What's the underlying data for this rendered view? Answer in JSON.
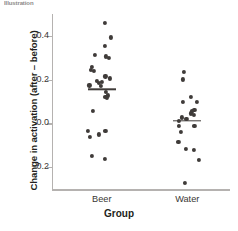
{
  "figure": {
    "top_sliver_text": "Illustration",
    "background": "#ffffff",
    "dot_color": "#3f3b39",
    "axis_color": "#b5b2b0"
  },
  "chart_data": {
    "type": "scatter",
    "title": "",
    "xlabel": "Group",
    "ylabel": "Change in activation (after – before)",
    "categories": [
      "Beer",
      "Water"
    ],
    "ytick_labels": [
      "0.4",
      "0.2",
      "0.0",
      "−0.2"
    ],
    "ytick_values": [
      0.4,
      0.2,
      0.0,
      -0.2
    ],
    "ylim": [
      -0.3,
      0.5
    ],
    "grid": false,
    "legend": "none",
    "annotations": [
      "horizontal bar marks the group mean"
    ],
    "series": [
      {
        "name": "Beer",
        "mean": 0.155,
        "jitter_center_pct": 28,
        "points": [
          {
            "x_pct": 29.5,
            "y": 0.459
          },
          {
            "x_pct": 33.0,
            "y": 0.393
          },
          {
            "x_pct": 29.5,
            "y": 0.355
          },
          {
            "x_pct": 24.0,
            "y": 0.312
          },
          {
            "x_pct": 32.0,
            "y": 0.301
          },
          {
            "x_pct": 30.5,
            "y": 0.306
          },
          {
            "x_pct": 22.5,
            "y": 0.257
          },
          {
            "x_pct": 22.0,
            "y": 0.246
          },
          {
            "x_pct": 23.5,
            "y": 0.241
          },
          {
            "x_pct": 30.0,
            "y": 0.215
          },
          {
            "x_pct": 32.5,
            "y": 0.206
          },
          {
            "x_pct": 25.0,
            "y": 0.195
          },
          {
            "x_pct": 28.0,
            "y": 0.19
          },
          {
            "x_pct": 26.5,
            "y": 0.186
          },
          {
            "x_pct": 21.0,
            "y": 0.174
          },
          {
            "x_pct": 27.5,
            "y": 0.171
          },
          {
            "x_pct": 30.5,
            "y": 0.145
          },
          {
            "x_pct": 31.5,
            "y": 0.128
          },
          {
            "x_pct": 30.0,
            "y": 0.122
          },
          {
            "x_pct": 31.0,
            "y": 0.117
          },
          {
            "x_pct": 23.0,
            "y": 0.057
          },
          {
            "x_pct": 20.0,
            "y": -0.035
          },
          {
            "x_pct": 30.0,
            "y": -0.033
          },
          {
            "x_pct": 26.5,
            "y": -0.05
          },
          {
            "x_pct": 21.5,
            "y": -0.061
          },
          {
            "x_pct": 22.5,
            "y": -0.147
          },
          {
            "x_pct": 29.5,
            "y": -0.164
          }
        ]
      },
      {
        "name": "Water",
        "mean": 0.012,
        "jitter_center_pct": 76,
        "points": [
          {
            "x_pct": 74.0,
            "y": 0.236
          },
          {
            "x_pct": 73.5,
            "y": 0.201
          },
          {
            "x_pct": 78.0,
            "y": 0.122
          },
          {
            "x_pct": 81.5,
            "y": 0.099
          },
          {
            "x_pct": 73.5,
            "y": 0.099
          },
          {
            "x_pct": 80.0,
            "y": 0.062
          },
          {
            "x_pct": 78.5,
            "y": 0.055
          },
          {
            "x_pct": 78.0,
            "y": 0.046
          },
          {
            "x_pct": 79.5,
            "y": 0.039
          },
          {
            "x_pct": 73.0,
            "y": 0.027
          },
          {
            "x_pct": 75.5,
            "y": 0.021
          },
          {
            "x_pct": 71.5,
            "y": 0.012
          },
          {
            "x_pct": 80.0,
            "y": -0.012
          },
          {
            "x_pct": 71.5,
            "y": -0.01
          },
          {
            "x_pct": 72.5,
            "y": -0.04
          },
          {
            "x_pct": 71.0,
            "y": -0.083
          },
          {
            "x_pct": 75.0,
            "y": -0.117
          },
          {
            "x_pct": 79.5,
            "y": -0.121
          },
          {
            "x_pct": 82.5,
            "y": -0.167
          },
          {
            "x_pct": 74.5,
            "y": -0.272
          }
        ]
      }
    ]
  }
}
